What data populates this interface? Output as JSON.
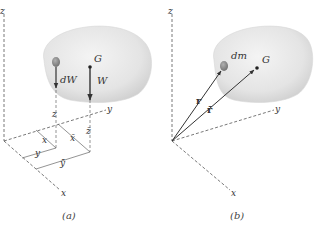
{
  "panels": [
    {
      "caption": "(a)",
      "axes": {
        "x": "x",
        "y": "y",
        "z": "z"
      },
      "labels": {
        "element_force": "dW",
        "total_force": "W",
        "centroid": "G",
        "elem_z": "z",
        "elem_x": "x",
        "elem_y": "y",
        "bar_z": "z̄",
        "bar_x": "x̄",
        "bar_y": "ȳ"
      }
    },
    {
      "caption": "(b)",
      "axes": {
        "x": "x",
        "y": "y",
        "z": "z"
      },
      "labels": {
        "element": "dm",
        "centroid": "G",
        "r": "r",
        "r_bar": "r̄"
      }
    }
  ],
  "colors": {
    "body_fill": "#e6e6e6",
    "body_edge": "#cfcfcf",
    "element": "#8a8a8a",
    "line": "#333333"
  }
}
